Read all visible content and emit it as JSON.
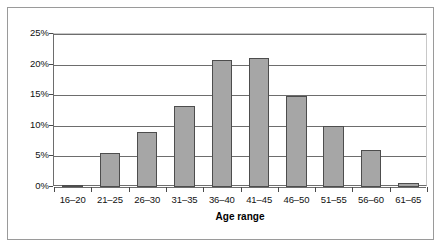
{
  "chart_data": {
    "type": "bar",
    "title": "",
    "xlabel": "Age range",
    "ylabel": "",
    "categories": [
      "16–20",
      "21–25",
      "26–30",
      "31–35",
      "36–40",
      "41–45",
      "46–50",
      "51–55",
      "56–60",
      "61–65"
    ],
    "values": [
      0.3,
      5.6,
      9.0,
      13.3,
      20.8,
      21.0,
      14.8,
      10.0,
      6.1,
      0.6
    ],
    "ylim": [
      0,
      25
    ],
    "ytick_labels": [
      "25%",
      "20%",
      "15%",
      "10%",
      "5%",
      "0%"
    ],
    "ytick_values": [
      25,
      20,
      15,
      10,
      5,
      0
    ],
    "grid": true,
    "legend": "none",
    "units": "percent",
    "bar_color": "#a6a6a6",
    "bar_border_color": "#4d4d4d",
    "gridline_color": "#6d6d6d",
    "frame_color": "#9a9a9a"
  }
}
